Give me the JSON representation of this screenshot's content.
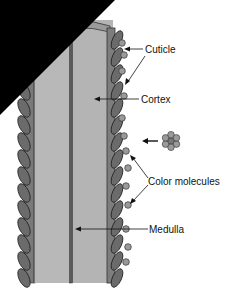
{
  "diagram": {
    "labels": {
      "cuticle": "Cuticle",
      "cortex": "Cortex",
      "color_molecules": "Color molecules",
      "medulla": "Medulla"
    },
    "icons": {
      "molecule_cluster": "color-molecule-cluster-icon"
    },
    "colors": {
      "cortex": "#b4b4b4",
      "cuticle": "#7a7a7a",
      "scale": "#6b6b6b",
      "molecule": "#9a9a9a",
      "medulla": "#555555",
      "corner_mask": "#000000"
    }
  }
}
